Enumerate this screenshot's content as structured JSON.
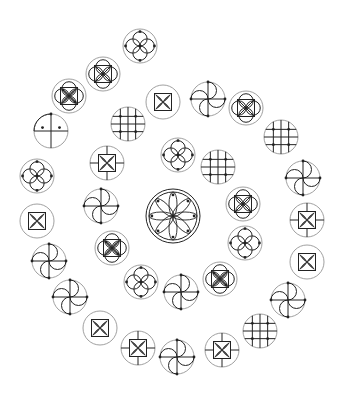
{
  "colors": {
    "background": "#ffffff",
    "outline": "#888888",
    "stroke": "#222222"
  },
  "center": {
    "x": 173,
    "y": 216,
    "r": 27,
    "type": "rosette"
  },
  "symbols": [
    {
      "x": 140,
      "y": 46,
      "r": 17,
      "type": "four-petal"
    },
    {
      "x": 103,
      "y": 74,
      "r": 17,
      "type": "petal-square"
    },
    {
      "x": 69,
      "y": 96,
      "r": 17,
      "type": "square-leaf-ring"
    },
    {
      "x": 51,
      "y": 131,
      "r": 17,
      "type": "quarter-grid"
    },
    {
      "x": 37,
      "y": 176,
      "r": 17,
      "type": "four-petal"
    },
    {
      "x": 37,
      "y": 221,
      "r": 17,
      "type": "leaf-square"
    },
    {
      "x": 49,
      "y": 261,
      "r": 17,
      "type": "swirl"
    },
    {
      "x": 70,
      "y": 297,
      "r": 17,
      "type": "swirl"
    },
    {
      "x": 100,
      "y": 328,
      "r": 17,
      "type": "leaf-square"
    },
    {
      "x": 138,
      "y": 348,
      "r": 17,
      "type": "leaf-square-cross"
    },
    {
      "x": 177,
      "y": 357,
      "r": 17,
      "type": "swirl"
    },
    {
      "x": 222,
      "y": 350,
      "r": 17,
      "type": "leaf-square-cross"
    },
    {
      "x": 260,
      "y": 331,
      "r": 17,
      "type": "grid-nodes"
    },
    {
      "x": 288,
      "y": 300,
      "r": 17,
      "type": "swirl"
    },
    {
      "x": 307,
      "y": 262,
      "r": 17,
      "type": "leaf-square"
    },
    {
      "x": 307,
      "y": 220,
      "r": 17,
      "type": "leaf-square-cross"
    },
    {
      "x": 303,
      "y": 178,
      "r": 17,
      "type": "swirl"
    },
    {
      "x": 281,
      "y": 137,
      "r": 17,
      "type": "grid-nodes"
    },
    {
      "x": 246,
      "y": 108,
      "r": 17,
      "type": "petal-square"
    },
    {
      "x": 208,
      "y": 99,
      "r": 17,
      "type": "swirl"
    },
    {
      "x": 163,
      "y": 102,
      "r": 17,
      "type": "leaf-square"
    },
    {
      "x": 128,
      "y": 124,
      "r": 17,
      "type": "grid-nodes"
    },
    {
      "x": 107,
      "y": 163,
      "r": 17,
      "type": "leaf-square-cross"
    },
    {
      "x": 101,
      "y": 206,
      "r": 17,
      "type": "swirl"
    },
    {
      "x": 112,
      "y": 248,
      "r": 17,
      "type": "leaf-square-ring"
    },
    {
      "x": 141,
      "y": 282,
      "r": 17,
      "type": "four-petal"
    },
    {
      "x": 181,
      "y": 292,
      "r": 17,
      "type": "swirl"
    },
    {
      "x": 220,
      "y": 279,
      "r": 17,
      "type": "leaf-square-ring"
    },
    {
      "x": 245,
      "y": 243,
      "r": 17,
      "type": "four-petal"
    },
    {
      "x": 243,
      "y": 204,
      "r": 17,
      "type": "petal-square"
    },
    {
      "x": 218,
      "y": 167,
      "r": 17,
      "type": "grid-nodes"
    },
    {
      "x": 178,
      "y": 155,
      "r": 17,
      "type": "four-petal"
    }
  ]
}
